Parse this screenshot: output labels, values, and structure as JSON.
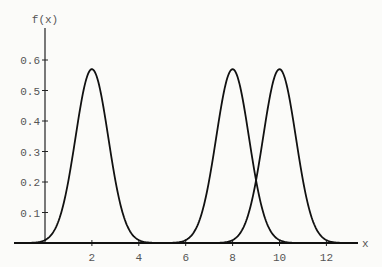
{
  "chart_data": {
    "type": "line",
    "title": "",
    "xlabel": "x",
    "ylabel": "f(x)",
    "xlim": [
      -1.3,
      13.5
    ],
    "ylim": [
      0,
      0.6
    ],
    "x_ticks": [
      2,
      4,
      6,
      8,
      10,
      12
    ],
    "y_ticks": [
      0.1,
      0.2,
      0.3,
      0.4,
      0.5,
      0.6
    ],
    "grid": false,
    "legend": null,
    "series": [
      {
        "name": "N(2, 0.7)",
        "kind": "normal_pdf",
        "mean": 2,
        "sd": 0.7,
        "peak": 0.57
      },
      {
        "name": "N(8, 0.7)",
        "kind": "normal_pdf",
        "mean": 8,
        "sd": 0.7,
        "peak": 0.57
      },
      {
        "name": "N(10, 0.7)",
        "kind": "normal_pdf",
        "mean": 10,
        "sd": 0.7,
        "peak": 0.57
      }
    ],
    "colors": {
      "curve": "#111111",
      "axis": "#222222",
      "text": "#555555"
    }
  }
}
